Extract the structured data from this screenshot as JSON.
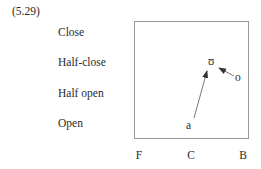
{
  "example_number": "(5.29)",
  "y_axis": {
    "labels": [
      "Close",
      "Half-close",
      "Half open",
      "Open"
    ]
  },
  "x_axis": {
    "labels": [
      "F",
      "C",
      "B"
    ]
  },
  "symbols": {
    "a": "a",
    "upsilon": "ʊ",
    "o": "o"
  },
  "arrows": [
    {
      "from": "a",
      "to": "ʊ"
    },
    {
      "from": "o",
      "to": "ʊ"
    }
  ],
  "colors": {
    "line": "#9a9a9a",
    "text": "#2a2a2a"
  }
}
